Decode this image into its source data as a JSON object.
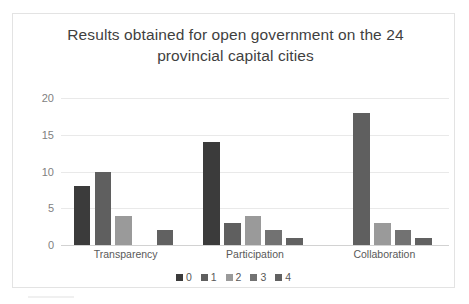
{
  "chart_data": {
    "type": "bar",
    "title": "Results obtained for open government on the 24 provincial capital cities",
    "title_line1": "Results obtained for open government on the 24",
    "title_line2": "provincial capital cities",
    "xlabel": "",
    "ylabel": "",
    "categories": [
      "Transparency",
      "Participation",
      "Collaboration"
    ],
    "ylim": [
      0,
      20
    ],
    "yticks": [
      0,
      5,
      10,
      15,
      20
    ],
    "ytick_labels": [
      "0",
      "5",
      "10",
      "15",
      "20"
    ],
    "grid": true,
    "legend_position": "bottom",
    "series": [
      {
        "name": "0",
        "color": "#3b3b3b",
        "values": [
          8,
          14,
          0
        ]
      },
      {
        "name": "1",
        "color": "#5f5f5f",
        "values": [
          10,
          3,
          18
        ]
      },
      {
        "name": "2",
        "color": "#9a9a9a",
        "values": [
          4,
          4,
          3
        ]
      },
      {
        "name": "3",
        "color": "#727272",
        "values": [
          0,
          2,
          2
        ]
      },
      {
        "name": "4",
        "color": "#616161",
        "values": [
          2,
          1,
          1
        ]
      }
    ]
  }
}
